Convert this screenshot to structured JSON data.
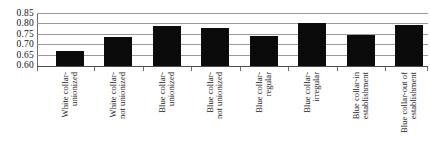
{
  "chart_data": {
    "type": "bar",
    "title": "",
    "subtitle": "",
    "xlabel": "",
    "ylabel": "",
    "ylim": [
      0.6,
      0.85
    ],
    "yticks": [
      "0.60",
      "0.65",
      "0.70",
      "0.75",
      "0.80",
      "0.85"
    ],
    "ytick_values": [
      0.6,
      0.65,
      0.7,
      0.75,
      0.8,
      0.85
    ],
    "grid": true,
    "legend": false,
    "legend_position": "none",
    "bar_color": "#0b0b0b",
    "categories": [
      "White collar-unionized",
      "White collar-not unionized",
      "Blue collar-unionized",
      "Blue collar-not unionized",
      "Blue collar-regular",
      "Blue collar-irregular",
      "Blue collar-in establishment",
      "Blue collar-out of establishment"
    ],
    "category_lines": [
      [
        "White collar-",
        "unionized"
      ],
      [
        "White collar-",
        "not unionized"
      ],
      [
        "Blue collar-",
        "unionized"
      ],
      [
        "Blue collar-",
        "not unionized"
      ],
      [
        "Blue collar-",
        "regular"
      ],
      [
        "Blue collar-",
        "irregular"
      ],
      [
        "Blue collar-in",
        "establishment"
      ],
      [
        "Blue collar-out of",
        "establishment"
      ]
    ],
    "values": [
      0.672,
      0.737,
      0.787,
      0.78,
      0.742,
      0.805,
      0.746,
      0.794
    ]
  }
}
